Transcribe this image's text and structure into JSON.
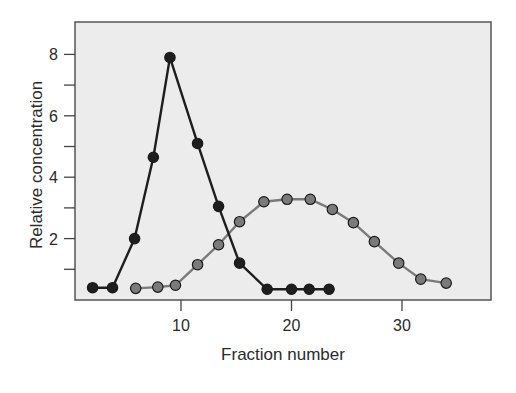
{
  "chart_data": {
    "type": "line",
    "title": "",
    "xlabel": "Fraction number",
    "ylabel": "Relative concentration",
    "xlim": [
      0,
      38
    ],
    "ylim": [
      0,
      9.2
    ],
    "x_ticks": [
      10,
      20,
      30
    ],
    "y_ticks_labeled": [
      2,
      4,
      6,
      8
    ],
    "y_ticks_minor": [
      1,
      3,
      5,
      7
    ],
    "grid": false,
    "legend": null,
    "background": "#ececec",
    "series": [
      {
        "name": "Dark series",
        "color": "#1e1e1e",
        "x": [
          2,
          3.8,
          5.8,
          7.5,
          9,
          11.5,
          13.4,
          15.3,
          17.8,
          20,
          21.6,
          23.4
        ],
        "y": [
          0.4,
          0.4,
          2.0,
          4.65,
          7.9,
          5.1,
          3.05,
          1.2,
          0.35,
          0.35,
          0.35,
          0.35
        ]
      },
      {
        "name": "Gray series",
        "color": "#7a7a7a",
        "x": [
          5.9,
          7.9,
          9.5,
          11.5,
          13.4,
          15.3,
          17.5,
          19.6,
          21.7,
          23.7,
          25.6,
          27.5,
          29.7,
          31.7,
          34
        ],
        "y": [
          0.38,
          0.42,
          0.48,
          1.15,
          1.8,
          2.55,
          3.2,
          3.28,
          3.28,
          2.95,
          2.52,
          1.9,
          1.2,
          0.68,
          0.55
        ]
      }
    ]
  }
}
